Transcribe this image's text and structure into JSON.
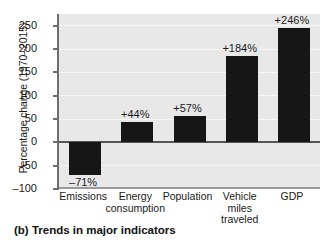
{
  "figure": {
    "caption": "(b) Trends in major indicators"
  },
  "chart_data": {
    "type": "bar",
    "title": "",
    "subtitle": "",
    "xlabel": "",
    "ylabel": "Percentage change (1970–2015)",
    "categories": [
      "Emissions",
      "Energy\nconsumption",
      "Population",
      "Vehicle\nmiles\ntraveled",
      "GDP"
    ],
    "values": [
      -71,
      44,
      57,
      184,
      246
    ],
    "data_labels": [
      "–71%",
      "+44%",
      "+57%",
      "+184%",
      "+246%"
    ],
    "ylim": [
      -100,
      275
    ],
    "yticks": [
      -100,
      -50,
      0,
      50,
      100,
      150,
      200,
      250
    ],
    "ytick_labels": [
      "–100",
      "–50",
      "0",
      "50",
      "100",
      "150",
      "200",
      "250"
    ],
    "grid": true,
    "legend": false,
    "bar_color": "#161616",
    "plot_background": "#e8e8e8",
    "zero_line_color": "#555555",
    "axis_color": "#6e6e6e"
  }
}
